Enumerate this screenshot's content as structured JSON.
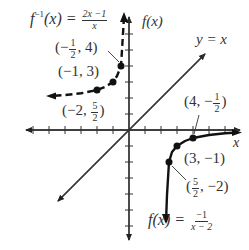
{
  "figure": {
    "axes": {
      "x_label": "x",
      "y_label": "f(x)",
      "origin_px": [
        129,
        130
      ],
      "unit_px": 16,
      "x_ticks": [
        -6,
        -5,
        -4,
        -3,
        -2,
        -1,
        1,
        2,
        3,
        4,
        5,
        6
      ],
      "y_ticks": [
        -6,
        -5,
        -4,
        -3,
        -2,
        -1,
        1,
        2,
        3,
        4,
        5,
        6
      ]
    },
    "line_y_equals_x": {
      "label": "y = x"
    },
    "f": {
      "name": "f(x)",
      "numerator": "−1",
      "denominator": "x − 2",
      "style": "solid",
      "points": [
        {
          "x": 2.5,
          "y": -2,
          "label_pre": "(",
          "label_num": "5",
          "label_den": "2",
          "label_post": ", −2)"
        },
        {
          "x": 3,
          "y": -1,
          "label": "(3, −1)"
        },
        {
          "x": 4,
          "y": -0.5,
          "label_pre": "(4, −",
          "label_num": "1",
          "label_den": "2",
          "label_post": ")"
        }
      ]
    },
    "f_inverse": {
      "name": "f",
      "sup": "−1",
      "arg": "(x) =",
      "numerator": "2x −1",
      "denominator": "x",
      "style": "dashed",
      "points": [
        {
          "x": -0.5,
          "y": 4,
          "label_pre": "(−",
          "label_num": "1",
          "label_den": "2",
          "label_post": ", 4)"
        },
        {
          "x": -1,
          "y": 3,
          "label": "(−1, 3)"
        },
        {
          "x": -2,
          "y": 2.5,
          "label_pre": "(−2, ",
          "label_num": "5",
          "label_den": "2",
          "label_post": ")"
        }
      ]
    },
    "f_equation_prefix": "f(x) =",
    "colors": {
      "ink": "#222222",
      "axis": "#333333",
      "background": "#ffffff"
    }
  }
}
